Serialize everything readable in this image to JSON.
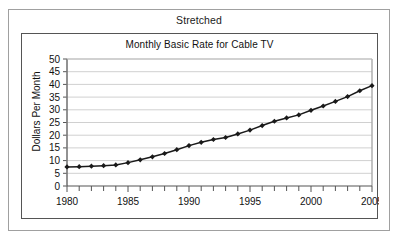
{
  "window": {
    "outer_label": "Stretched"
  },
  "chart_data": {
    "type": "line",
    "title": "Monthly Basic Rate for Cable TV",
    "xlabel": "",
    "ylabel": "Dollars Per Month",
    "xlim": [
      1980,
      2005
    ],
    "ylim": [
      0,
      50
    ],
    "grid": true,
    "legend": false,
    "marker": "diamond",
    "line_color": "#1a1a1a",
    "gridline_color": "#d0d0d0",
    "yticks": [
      0,
      5,
      10,
      15,
      20,
      25,
      30,
      35,
      40,
      45,
      50
    ],
    "ytick_labels": [
      "0",
      "5",
      "10",
      "15",
      "20",
      "25",
      "30",
      "35",
      "40",
      "45",
      "50"
    ],
    "xticks": [
      1980,
      1985,
      1990,
      1995,
      2000,
      2005
    ],
    "xtick_labels": [
      "1980",
      "1985",
      "1990",
      "1995",
      "2000",
      "2005"
    ],
    "x_minor_tick_step": 1,
    "x": [
      1980,
      1981,
      1982,
      1983,
      1984,
      1985,
      1986,
      1987,
      1988,
      1989,
      1990,
      1991,
      1992,
      1993,
      1994,
      1995,
      1996,
      1997,
      1998,
      1999,
      2000,
      2001,
      2002,
      2003,
      2004,
      2005
    ],
    "values": [
      7.5,
      7.6,
      7.8,
      8.0,
      8.3,
      9.2,
      10.3,
      11.5,
      12.8,
      14.3,
      15.9,
      17.2,
      18.3,
      19.1,
      20.5,
      22.0,
      23.8,
      25.5,
      26.8,
      28.0,
      29.8,
      31.5,
      33.3,
      35.2,
      37.5,
      39.5
    ]
  }
}
